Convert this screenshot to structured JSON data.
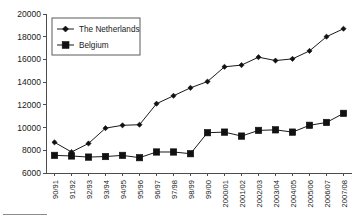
{
  "chart_data": {
    "type": "line",
    "title": "",
    "subtitle": "",
    "xlabel": "",
    "ylabel": "",
    "ylim": [
      6000,
      20000
    ],
    "ytick_step": 2000,
    "yticks": [
      "20000",
      "18000",
      "16000",
      "14000",
      "12000",
      "10000",
      "8000",
      "6000"
    ],
    "ytick_values": [
      20000,
      18000,
      16000,
      14000,
      12000,
      10000,
      8000,
      6000
    ],
    "grid": false,
    "legend_position": "top-left-inside",
    "categories": [
      "90/91",
      "91/92",
      "92/93",
      "93/94",
      "94/95",
      "95/96",
      "96/97",
      "97/98",
      "98/99",
      "99/00",
      "2000/01",
      "2001/02",
      "2002/03",
      "2003/04",
      "2004/05",
      "2005/06",
      "2006/07",
      "2007/08"
    ],
    "series": [
      {
        "name": "The Netherlands",
        "marker": "diamond",
        "color": "#111111",
        "values": [
          8700,
          7850,
          8600,
          9950,
          10200,
          10250,
          12100,
          12800,
          13500,
          14050,
          15350,
          15500,
          16200,
          15900,
          16050,
          16750,
          18000,
          18700
        ]
      },
      {
        "name": "Belgium",
        "marker": "square",
        "color": "#111111",
        "values": [
          7550,
          7500,
          7400,
          7450,
          7550,
          7350,
          7850,
          7850,
          7700,
          9550,
          9600,
          9250,
          9750,
          9800,
          9600,
          10200,
          10450,
          11250
        ]
      }
    ]
  },
  "legend": {
    "entries": [
      {
        "label": "The Netherlands",
        "marker": "diamond-marker"
      },
      {
        "label": "Belgium",
        "marker": "square-marker"
      }
    ]
  }
}
